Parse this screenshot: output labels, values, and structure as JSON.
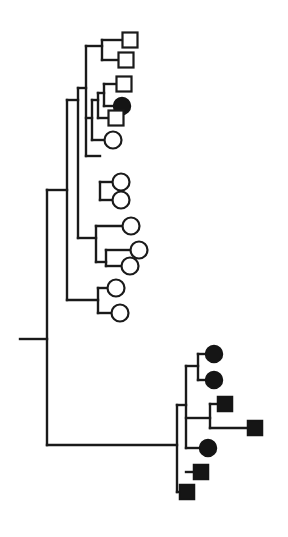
{
  "diagram": {
    "type": "phylogenetic-tree",
    "legend_text": "",
    "colors": {
      "line": "#1a1a1a",
      "filled": "#151515",
      "open": "#ffffff",
      "background": "#ffffff"
    },
    "branches": [
      "M20,339 H47",
      "M47,190 V445",
      "M47,190 H67",
      "M67,100 V300",
      "M67,300 H98",
      "M98,288 V313",
      "M98,288 H110",
      "M98,313 H114",
      "M67,100 H78",
      "M78,238 H96",
      "M78,88 V238",
      "M96,226 V262",
      "M96,226 H125",
      "M96,262 H106",
      "M106,250 V266",
      "M106,250 H133",
      "M106,266 H125",
      "M78,88 H86",
      "M86,46 V156",
      "M86,156 H100",
      "M100,182 V200",
      "M100,182 H114",
      "M100,200 H114",
      "M86,46 H102",
      "M102,40 V60",
      "M102,40 H124",
      "M102,60 H120",
      "M86,118 H92",
      "M92,100 V140",
      "M92,140 H106",
      "M92,100 H98",
      "M98,93 V118",
      "M98,118 H110",
      "M98,93 H104",
      "M104,84 V106",
      "M104,84 H118",
      "M104,106 H118",
      "M47,445 H177",
      "M177,405 V492",
      "M177,405 H186",
      "M186,366 V448",
      "M186,366 H198",
      "M198,354 V380",
      "M198,354 H208",
      "M198,380 H208",
      "M186,418 H210",
      "M210,404 V428",
      "M210,404 H220",
      "M210,428 H250",
      "M186,448 H202",
      "M186,472 H196",
      "M177,492 H182"
    ],
    "leaves": [
      {
        "shape": "square",
        "fill": "open",
        "x": 130,
        "y": 40
      },
      {
        "shape": "square",
        "fill": "open",
        "x": 126,
        "y": 60
      },
      {
        "shape": "square",
        "fill": "open",
        "x": 124,
        "y": 84
      },
      {
        "shape": "circle",
        "fill": "filled",
        "x": 122,
        "y": 106
      },
      {
        "shape": "square",
        "fill": "open",
        "x": 116,
        "y": 118
      },
      {
        "shape": "circle",
        "fill": "open",
        "x": 113,
        "y": 140
      },
      {
        "shape": "circle",
        "fill": "open",
        "x": 121,
        "y": 182
      },
      {
        "shape": "circle",
        "fill": "open",
        "x": 121,
        "y": 200
      },
      {
        "shape": "circle",
        "fill": "open",
        "x": 131,
        "y": 226
      },
      {
        "shape": "circle",
        "fill": "open",
        "x": 139,
        "y": 250
      },
      {
        "shape": "circle",
        "fill": "open",
        "x": 130,
        "y": 266
      },
      {
        "shape": "circle",
        "fill": "open",
        "x": 116,
        "y": 288
      },
      {
        "shape": "circle",
        "fill": "open",
        "x": 120,
        "y": 313
      },
      {
        "shape": "circle",
        "fill": "filled",
        "x": 214,
        "y": 354
      },
      {
        "shape": "circle",
        "fill": "filled",
        "x": 214,
        "y": 380
      },
      {
        "shape": "square",
        "fill": "filled",
        "x": 225,
        "y": 404
      },
      {
        "shape": "square",
        "fill": "filled",
        "x": 255,
        "y": 428
      },
      {
        "shape": "circle",
        "fill": "filled",
        "x": 208,
        "y": 448
      },
      {
        "shape": "square",
        "fill": "filled",
        "x": 201,
        "y": 472
      },
      {
        "shape": "square",
        "fill": "filled",
        "x": 187,
        "y": 492
      }
    ],
    "leaf_size": 15
  }
}
